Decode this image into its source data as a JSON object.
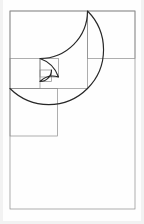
{
  "figure": {
    "background_color": "#fefefe",
    "stroke_color": "#2b2b2b",
    "grid_color": "#8c8c8c",
    "canvas": {
      "width": 144,
      "height": 224
    }
  },
  "chart_data": {
    "type": "diagram",
    "subtitle": "Nested golden-ratio squares with inscribed quarter-circle arcs",
    "xlabel": "",
    "ylabel": "",
    "grid": true,
    "legend": false,
    "outer_rectangle": {
      "x": 10,
      "y": 11,
      "width": 125,
      "height": 198,
      "ratio": "1.618"
    },
    "squares": [
      {
        "index": 1,
        "fib": 13,
        "x": 10,
        "y": 11,
        "size": 77.5,
        "arc_center": "bottom-right",
        "arc_from": "top-right",
        "arc_to": "bottom-left"
      },
      {
        "index": 2,
        "fib": 8,
        "x": 87.5,
        "y": 11,
        "size": 47.5,
        "arc_center": "bottom-left",
        "arc_from": "bottom-right",
        "arc_to": "top-left"
      },
      {
        "index": 3,
        "fib": 5,
        "x": 10,
        "y": 88.5,
        "size": 47.5,
        "arc_center": "top-right",
        "arc_from": "bottom-right",
        "arc_to": "top-left"
      },
      {
        "index": 4,
        "fib": 3,
        "x": 10,
        "y": 58.5,
        "size": 30.0,
        "arc_center": "top-right",
        "arc_from": "bottom-left",
        "arc_to": "top-right"
      },
      {
        "index": 5,
        "fib": 2,
        "x": 40,
        "y": 58.5,
        "size": 18.5,
        "arc_center": "bottom-left",
        "arc_from": "top-left",
        "arc_to": "bottom-right"
      },
      {
        "index": 6,
        "fib": 1,
        "x": 40,
        "y": 70.0,
        "size": 11.5,
        "arc_center": "top-left",
        "arc_from": "top-right",
        "arc_to": "bottom-left"
      }
    ],
    "fibonacci_sequence": [
      1,
      1,
      2,
      3,
      5,
      8,
      13
    ],
    "spiral": {
      "description": "quarter-circle arcs joined corner-to-corner forming a logarithmic golden spiral",
      "turns": 3,
      "growth_factor": 1.618
    }
  }
}
